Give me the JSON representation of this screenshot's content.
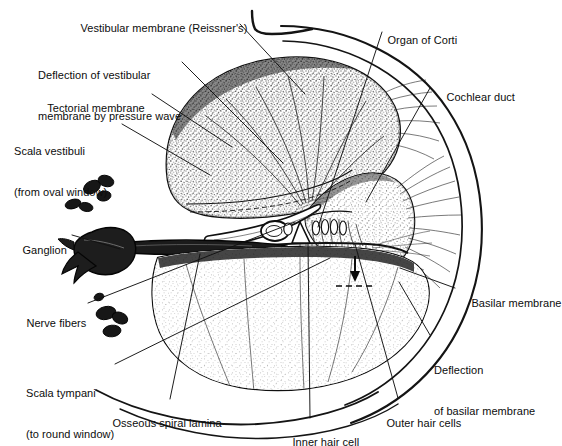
{
  "figure": {
    "background_color": "#ffffff",
    "ink_color": "#111111",
    "width": 557,
    "height": 446
  },
  "labels": [
    {
      "id": "vestibular-membrane",
      "text": "Vestibular membrane (Reissner's)",
      "x": 68,
      "y": 9,
      "lines": [
        "Vestibular membrane (Reissner's)"
      ]
    },
    {
      "id": "deflection-vestibular-membrane",
      "text": "Deflection of vestibular membrane by pressure wave",
      "x": 38,
      "y": 42,
      "lines": [
        "Deflection of vestibular",
        "membrane by pressure wave"
      ]
    },
    {
      "id": "tectorial-membrane",
      "text": "Tectorial membrane",
      "x": 35,
      "y": 89,
      "lines": [
        "Tectorial membrane"
      ]
    },
    {
      "id": "scala-vestibuli",
      "text": "Scala vestibuli (from oval window)",
      "x": 14,
      "y": 118,
      "lines": [
        "Scala vestibuli",
        "(from oval window)"
      ]
    },
    {
      "id": "ganglion",
      "text": "Ganglion",
      "x": 10,
      "y": 231,
      "lines": [
        "Ganglion"
      ]
    },
    {
      "id": "nerve-fibers",
      "text": "Nerve fibers",
      "x": 14,
      "y": 304,
      "lines": [
        "Nerve fibers"
      ]
    },
    {
      "id": "scala-tympani",
      "text": "Scala tympani (to round window)",
      "x": 26,
      "y": 360,
      "lines": [
        "Scala tympani",
        "(to round window)"
      ]
    },
    {
      "id": "osseous-spiral-lamina",
      "text": "Osseous spiral lamina",
      "x": 100,
      "y": 404,
      "lines": [
        "Osseous spiral lamina"
      ]
    },
    {
      "id": "inner-hair-cell",
      "text": "Inner hair cell",
      "x": 280,
      "y": 423,
      "lines": [
        "Inner hair cell"
      ]
    },
    {
      "id": "outer-hair-cells",
      "text": "Outer hair cells",
      "x": 374,
      "y": 404,
      "lines": [
        "Outer hair cells"
      ]
    },
    {
      "id": "deflection-basilar-membrane",
      "text": "Deflection of basilar membrane",
      "x": 434,
      "y": 337,
      "lines": [
        "Deflection",
        "of basilar membrane"
      ]
    },
    {
      "id": "basilar-membrane",
      "text": "Basilar membrane",
      "x": 459,
      "y": 284,
      "lines": [
        "Basilar membrane"
      ]
    },
    {
      "id": "cochlear-duct",
      "text": "Cochlear duct",
      "x": 434,
      "y": 78,
      "lines": [
        "Cochlear duct"
      ]
    },
    {
      "id": "organ-of-corti",
      "text": "Organ of Corti",
      "x": 375,
      "y": 21,
      "lines": [
        "Organ of Corti"
      ]
    }
  ],
  "structures": {
    "scala_vestibuli": "upper large stippled chamber",
    "scala_tympani": "lower large stippled chamber",
    "cochlear_duct": "triangular stippled chamber at right center",
    "organ_of_corti": "dense cellular detail at center between membranes",
    "spiral_ganglion": "dark solid wedge at left center",
    "nerve_fiber_bundles": "small dark clustered ovals left of the chambers",
    "deflection_arrow": "small downward arrow with dashed line in scala tympani",
    "corner_marker": "L-shaped hook mark at top center"
  }
}
